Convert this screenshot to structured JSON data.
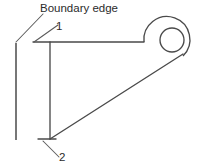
{
  "figure": {
    "type": "engineering-line-drawing",
    "background_color": "#ffffff",
    "line_color": "#4a4a4a",
    "text_color": "#2b2b2b",
    "canvas": {
      "width": 201,
      "height": 168
    }
  },
  "annotations": {
    "boundary_edge_label": "Boundary edge",
    "point_1_label": "1",
    "point_2_label": "2"
  },
  "geometry": {
    "boundary_edge": {
      "x": 16,
      "y1": 43,
      "y2": 140
    },
    "top_flange": {
      "x1": 33,
      "x2": 144,
      "y": 42
    },
    "vertical_web": {
      "x": 50,
      "y1": 42,
      "y2": 139
    },
    "bottom_tick": {
      "x1": 38,
      "x2": 56,
      "y": 139
    },
    "diagonal": {
      "x1": 50,
      "y1": 139,
      "x2": 186,
      "y2": 51
    },
    "hub": {
      "cx": 172,
      "cy": 40,
      "outer_r": 23,
      "inner_r": 12
    },
    "leader_boundary": {
      "x1": 16,
      "y1": 42,
      "x2": 43,
      "y2": 14
    },
    "leader_point_1": {
      "x1": 34,
      "y1": 42,
      "x2": 58,
      "y2": 24
    },
    "leader_point_2": {
      "x1": 43,
      "y1": 141,
      "x2": 60,
      "y2": 158
    }
  }
}
